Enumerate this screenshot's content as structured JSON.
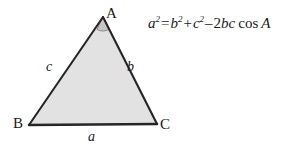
{
  "figure": {
    "type": "geometry-diagram",
    "background_color": "#ffffff",
    "triangle": {
      "fill_color": "#e2e2e2",
      "stroke_color": "#262626",
      "vertices": [
        {
          "name": "A",
          "label": "A",
          "x": 103,
          "y": 17
        },
        {
          "name": "B",
          "label": "B",
          "x": 29,
          "y": 125
        },
        {
          "name": "C",
          "label": "C",
          "x": 157,
          "y": 124
        }
      ],
      "sides": [
        {
          "name": "a",
          "label": "a",
          "between": "B-C"
        },
        {
          "name": "b",
          "label": "b",
          "between": "A-C"
        },
        {
          "name": "c",
          "label": "c",
          "between": "A-B"
        }
      ],
      "angle_marker": {
        "at_vertex": "A",
        "fill_color": "#c8c8c8"
      }
    },
    "formula": {
      "full_text": "a² = b² + c² − 2bc cos A",
      "lhs_base": "a",
      "lhs_exp": "2",
      "equals": "=",
      "t1_base": "b",
      "t1_exp": "2",
      "plus": "+",
      "t2_base": "c",
      "t2_exp": "2",
      "minus": "–",
      "coefficient": "2",
      "product": "bc",
      "function": "cos",
      "argument": "A"
    }
  }
}
